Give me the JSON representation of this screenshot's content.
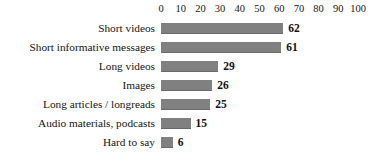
{
  "chart_data": {
    "type": "bar",
    "orientation": "horizontal",
    "title": "",
    "xlabel": "",
    "ylabel": "",
    "xlim": [
      0,
      100
    ],
    "xticks": [
      0,
      10,
      20,
      30,
      40,
      50,
      60,
      70,
      80,
      90,
      100
    ],
    "grid": false,
    "legend": null,
    "bar_color": "#808080",
    "categories": [
      "Short videos",
      "Short informative messages",
      "Long videos",
      "Images",
      "Long articles / longreads",
      "Audio materials, podcasts",
      "Hard to say"
    ],
    "values": [
      62,
      61,
      29,
      26,
      25,
      15,
      6
    ],
    "value_labels": [
      "62",
      "61",
      "29",
      "26",
      "25",
      "15",
      "6"
    ]
  }
}
